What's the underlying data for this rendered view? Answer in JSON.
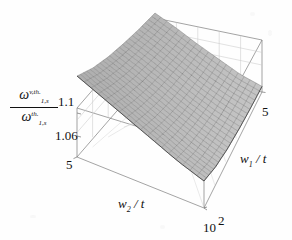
{
  "figure": {
    "background_color": "#fefefe",
    "line_color": "#6e6e6e",
    "surface_color": "#b8b8b8",
    "mesh_color": "#4a4a4a"
  },
  "axes": {
    "z": {
      "label_numerator_base": "ω",
      "label_numerator_sup": "v,th.",
      "label_numerator_sub": "1,s",
      "label_denominator_base": "ω",
      "label_denominator_sup": "th.",
      "label_denominator_sub": "1,s",
      "ticks": [
        "1.1",
        "1.06"
      ],
      "range": [
        1.04,
        1.12
      ]
    },
    "x": {
      "label_base": "w",
      "label_sub": "2",
      "label_suffix": " / t",
      "label_full": "w2 / t",
      "ticks": [
        "5",
        "10"
      ],
      "range": [
        5,
        10
      ]
    },
    "y": {
      "label_base": "w",
      "label_sub": "1",
      "label_suffix": " / t",
      "label_full": "w1 / t",
      "ticks": [
        "2",
        "5"
      ],
      "range": [
        2,
        5
      ]
    }
  },
  "chart_data": {
    "type": "surface",
    "title": "",
    "xlabel": "w2 / t",
    "ylabel": "w1 / t",
    "zlabel": "omega_{1,s}^{v,th.} / omega_{1,s}^{th.}",
    "xlim": [
      5,
      10
    ],
    "ylim": [
      2,
      5
    ],
    "zlim": [
      1.04,
      1.12
    ],
    "x_ticks": [
      5,
      10
    ],
    "y_ticks": [
      2,
      5
    ],
    "z_ticks": [
      1.06,
      1.1
    ],
    "grid": true,
    "legend": "none",
    "mesh_nx": 24,
    "mesh_ny": 18,
    "x": [
      5,
      6,
      7,
      8,
      9,
      10
    ],
    "y": [
      2,
      2.6,
      3.2,
      3.8,
      4.4,
      5
    ],
    "z": [
      [
        1.112,
        1.103,
        1.097,
        1.093,
        1.09,
        1.088
      ],
      [
        1.102,
        1.094,
        1.088,
        1.084,
        1.081,
        1.079
      ],
      [
        1.092,
        1.084,
        1.078,
        1.074,
        1.071,
        1.069
      ],
      [
        1.082,
        1.074,
        1.068,
        1.064,
        1.061,
        1.06
      ],
      [
        1.072,
        1.064,
        1.059,
        1.055,
        1.053,
        1.051
      ],
      [
        1.064,
        1.056,
        1.051,
        1.048,
        1.046,
        1.045
      ]
    ]
  }
}
